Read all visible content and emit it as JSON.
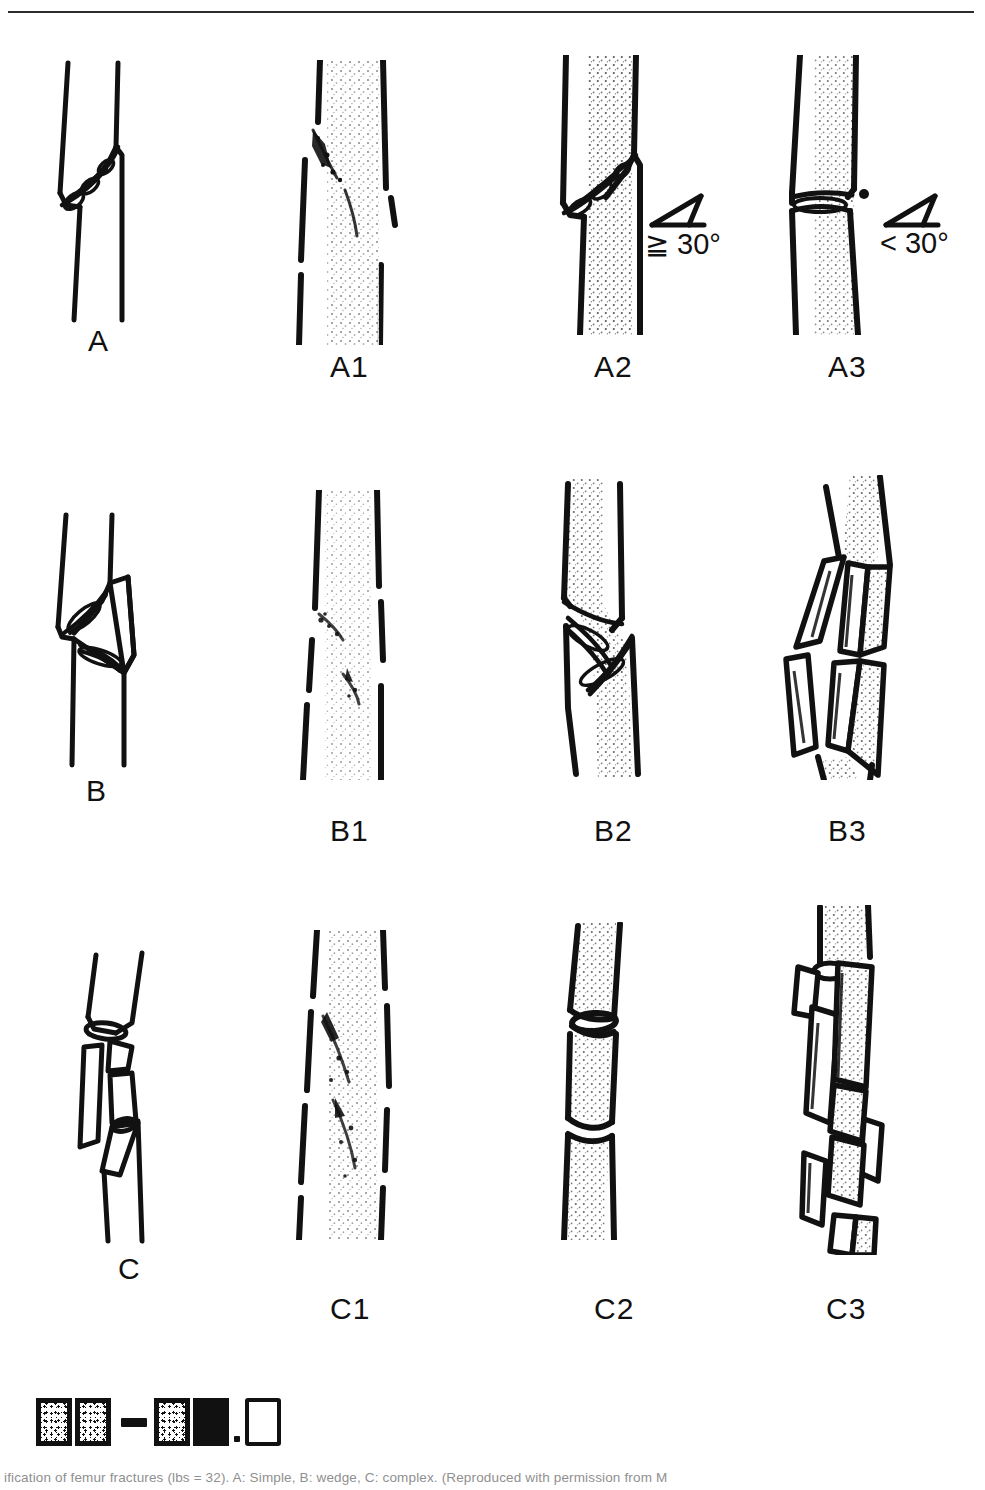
{
  "figure": {
    "top_rule": true,
    "rows": [
      {
        "id": "row-a",
        "group_label": "A",
        "items": [
          {
            "label": "A",
            "kind": "schematic-simple-fracture"
          },
          {
            "label": "A1",
            "kind": "radiograph-spiral"
          },
          {
            "label": "A2",
            "kind": "schematic-oblique",
            "angle_note": "≧ 30°"
          },
          {
            "label": "A3",
            "kind": "schematic-transverse",
            "angle_note": "< 30°"
          }
        ]
      },
      {
        "id": "row-b",
        "group_label": "B",
        "items": [
          {
            "label": "B",
            "kind": "schematic-wedge-fracture"
          },
          {
            "label": "B1",
            "kind": "radiograph-spiral-wedge"
          },
          {
            "label": "B2",
            "kind": "schematic-bending-wedge"
          },
          {
            "label": "B3",
            "kind": "schematic-fragmented-wedge"
          }
        ]
      },
      {
        "id": "row-c",
        "group_label": "C",
        "items": [
          {
            "label": "C",
            "kind": "schematic-complex-fracture"
          },
          {
            "label": "C1",
            "kind": "radiograph-spiral-complex"
          },
          {
            "label": "C2",
            "kind": "schematic-segmental"
          },
          {
            "label": "C3",
            "kind": "schematic-irregular"
          }
        ]
      }
    ],
    "angle_markers": [
      {
        "for": "A2",
        "text": "≧ 30°"
      },
      {
        "for": "A3",
        "text": "< 30°"
      }
    ],
    "legend": {
      "swatches": [
        {
          "name": "stipple-box-1",
          "style": "stippled"
        },
        {
          "name": "stipple-box-2",
          "style": "stippled"
        },
        {
          "name": "dash-separator",
          "style": "dash"
        },
        {
          "name": "stipple-box-3",
          "style": "stippled"
        },
        {
          "name": "solid-box",
          "style": "solid"
        },
        {
          "name": "period-mark",
          "style": "dot"
        },
        {
          "name": "open-box",
          "style": "open"
        }
      ]
    },
    "caption": "ification of femur fractures (lbs = 32). A: Simple, B: wedge, C: complex. (Reproduced with permission from M",
    "colors": {
      "ink": "#111111",
      "paper": "#ffffff",
      "rule": "#2b2b2b",
      "caption_grey": "#8f8f8f"
    }
  }
}
